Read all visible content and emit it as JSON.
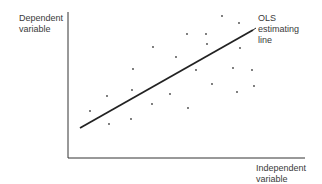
{
  "chart_data": {
    "type": "scatter",
    "title": "",
    "xlabel": "Independent variable",
    "ylabel": "Dependent variable",
    "grid": false,
    "legend": null,
    "annotations": [
      {
        "text": "OLS estimating line",
        "points_to": "regression line"
      }
    ],
    "points_px": [
      [
        222,
        16
      ],
      [
        239,
        23
      ],
      [
        187,
        34
      ],
      [
        206,
        34
      ],
      [
        153,
        47
      ],
      [
        207,
        44
      ],
      [
        240,
        48
      ],
      [
        176,
        57
      ],
      [
        133,
        69
      ],
      [
        196,
        70
      ],
      [
        233,
        68
      ],
      [
        252,
        70
      ],
      [
        212,
        84
      ],
      [
        254,
        86
      ],
      [
        132,
        90
      ],
      [
        237,
        92
      ],
      [
        107,
        96
      ],
      [
        170,
        94
      ],
      [
        152,
        104
      ],
      [
        188,
        108
      ],
      [
        90,
        111
      ],
      [
        131,
        119
      ],
      [
        109,
        124
      ]
    ],
    "regression_line_px": {
      "x1": 80,
      "y1": 128,
      "x2": 253,
      "y2": 30
    }
  },
  "labels": {
    "y_axis": "Dependent\nvariable",
    "x_axis": "Independent\nvariable",
    "line_annotation": "OLS\nestimating\nline"
  }
}
